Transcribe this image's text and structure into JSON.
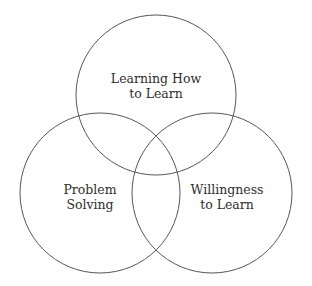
{
  "diagram": {
    "type": "venn",
    "stroke_color": "#555555",
    "text_color": "#2e2e2e",
    "background": "#ffffff",
    "sets": [
      {
        "id": "learning-how-to-learn",
        "label_lines": [
          "Learning How",
          "to Learn"
        ],
        "circle": {
          "cx": 156,
          "cy": 95,
          "r": 80
        },
        "label_pos": {
          "x": 156,
          "y1": 83,
          "y2": 98
        }
      },
      {
        "id": "problem-solving",
        "label_lines": [
          "Problem",
          "Solving"
        ],
        "circle": {
          "cx": 100,
          "cy": 193,
          "r": 80
        },
        "label_pos": {
          "x": 90,
          "y1": 194,
          "y2": 209
        }
      },
      {
        "id": "willingness-to-learn",
        "label_lines": [
          "Willingness",
          "to Learn"
        ],
        "circle": {
          "cx": 212,
          "cy": 193,
          "r": 80
        },
        "label_pos": {
          "x": 227,
          "y1": 194,
          "y2": 209
        }
      }
    ]
  }
}
